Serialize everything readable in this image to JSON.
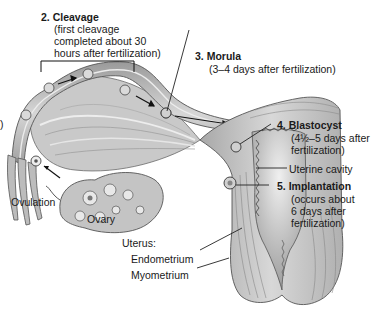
{
  "diagram": {
    "stages": [
      {
        "number": "2.",
        "title": "Cleavage",
        "detail": [
          "(first cleavage",
          "completed about 30",
          "hours after fertilization)"
        ]
      },
      {
        "number": "3.",
        "title": "Morula",
        "detail": [
          "(3–4 days after fertilization)"
        ]
      },
      {
        "number": "4.",
        "title": "Blastocyst",
        "detail": [
          "(4½–5 days after",
          "fertilization)"
        ]
      },
      {
        "number": "5.",
        "title": "Implantation",
        "detail": [
          "(occurs about",
          "6 days after",
          "fertilization)"
        ]
      }
    ],
    "labels": {
      "ovulation": "Ovulation",
      "ovary": "Ovary",
      "uterine_cavity": "Uterine cavity",
      "uterus": "Uterus:",
      "endometrium": "Endometrium",
      "myometrium": "Myometrium",
      "left_edge_fragment": ")"
    },
    "colors": {
      "tissue_light": "#d9d9d9",
      "tissue_mid": "#b3b3b3",
      "tissue_dark": "#7a7a7a",
      "outline": "#4d4d4d",
      "text": "#1a1a1a",
      "background": "#ffffff"
    }
  }
}
